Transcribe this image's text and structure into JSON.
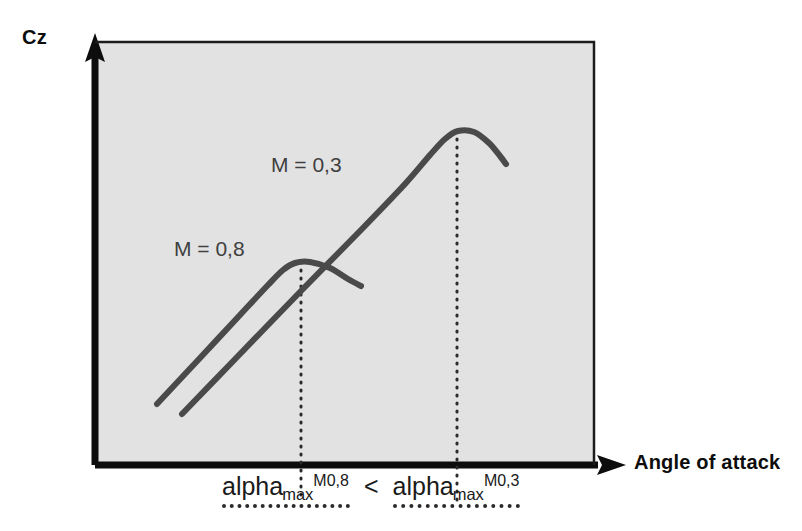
{
  "figure": {
    "background_color": "#ffffff",
    "plot_background_color": "#e2e2e2",
    "axis_color": "#0d0d0d",
    "curve_color": "#4a4a4a",
    "guide_color": "#2b2b2b"
  },
  "axes": {
    "y_title": "Cz",
    "x_title": "Angle of attack"
  },
  "annotations": {
    "alpha_low_base": "alpha",
    "alpha_low_sub": "max",
    "alpha_low_sup": "M0,8",
    "operator": "<",
    "alpha_high_base": "alpha",
    "alpha_high_sub": "max",
    "alpha_high_sup": "M0,3"
  },
  "chart_data": {
    "type": "line",
    "title": "",
    "xlabel": "Angle of attack",
    "ylabel": "Cz",
    "grid": false,
    "legend": "inline-labels",
    "axis_style": "arrows, no tick marks, no numeric scale",
    "xlim": [
      0,
      1
    ],
    "ylim": [
      0,
      1
    ],
    "series": [
      {
        "name": "M = 0,3",
        "label": "M = 0,3",
        "label_position": {
          "x": 271,
          "y": 153
        },
        "color": "#4a4a4a",
        "points": [
          {
            "x": 182,
            "y": 414
          },
          {
            "x": 240,
            "y": 354
          },
          {
            "x": 300,
            "y": 292
          },
          {
            "x": 360,
            "y": 231
          },
          {
            "x": 405,
            "y": 184
          },
          {
            "x": 430,
            "y": 155
          },
          {
            "x": 445,
            "y": 139
          },
          {
            "x": 458,
            "y": 131
          },
          {
            "x": 474,
            "y": 132
          },
          {
            "x": 489,
            "y": 143
          },
          {
            "x": 500,
            "y": 156
          },
          {
            "x": 506,
            "y": 164
          }
        ],
        "alpha_max_x": 457,
        "peak": {
          "x": 458,
          "y": 131
        }
      },
      {
        "name": "M = 0,8",
        "label": "M = 0,8",
        "label_position": {
          "x": 174,
          "y": 237
        },
        "color": "#4a4a4a",
        "points": [
          {
            "x": 157,
            "y": 404
          },
          {
            "x": 200,
            "y": 358
          },
          {
            "x": 240,
            "y": 315
          },
          {
            "x": 268,
            "y": 285
          },
          {
            "x": 283,
            "y": 270
          },
          {
            "x": 295,
            "y": 263
          },
          {
            "x": 310,
            "y": 262
          },
          {
            "x": 330,
            "y": 268
          },
          {
            "x": 348,
            "y": 279
          },
          {
            "x": 361,
            "y": 286
          }
        ],
        "alpha_max_x": 301,
        "peak": {
          "x": 300,
          "y": 262
        }
      }
    ],
    "guide_lines": [
      {
        "name": "alpha-max-m08-guide",
        "x": 301,
        "y_from": 262,
        "y_to": 500,
        "style": "dotted"
      },
      {
        "name": "alpha-max-m03-guide",
        "x": 457,
        "y_from": 131,
        "y_to": 500,
        "style": "dotted"
      }
    ],
    "plot_area": {
      "left": 95,
      "top": 42,
      "right": 594,
      "bottom": 465
    },
    "note": "Maximum lift coefficient occurs at a lower angle of attack for M = 0,8 than for M = 0,3"
  }
}
